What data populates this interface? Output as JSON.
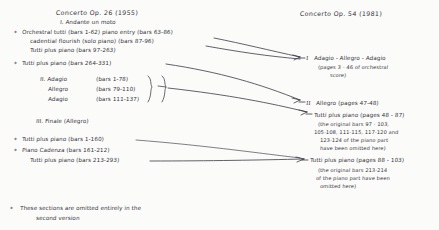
{
  "page": {
    "background_color": "#fbfbf9",
    "ink_color": "#33333c"
  },
  "left_column": {
    "heading": "Concerto Op. 26  (1955)",
    "movement_1": {
      "label": "I. Andante un moto",
      "lines": [
        {
          "star": "*",
          "text": "Orchestral tutti (bars 1-62) piano entry (bars 63-86)"
        },
        {
          "star": "",
          "text": "cadential flourish (solo piano) (bars 87-96)"
        },
        {
          "star": "",
          "text": "Tutti plus piano (bars 97-263)"
        },
        {
          "star": "*",
          "text": "Tutti plus piano (bars 264-331)"
        }
      ]
    },
    "movement_2": {
      "label": "II. Adagio",
      "lines": [
        {
          "text": "Adagio",
          "bars": "(bars 1-78)"
        },
        {
          "text": "Allegro",
          "bars": "(bars 79-110)"
        },
        {
          "text": "Adagio",
          "bars": "(bars 111-137)"
        }
      ]
    },
    "movement_3": {
      "label": "III. Finale (Allegro)",
      "lines": [
        {
          "star": "*",
          "text": "Tutti plus piano (bars 1-160)"
        },
        {
          "star": "*",
          "text": "Piano Cadenza (bars 161-212)"
        },
        {
          "star": "",
          "text": "Tutti plus piano (bars 213-293)"
        }
      ]
    }
  },
  "right_column": {
    "heading": "Concerto   Op. 54  (1981)",
    "entries": [
      {
        "numeral": "I",
        "title": "Adagio - Allegro - Adagio",
        "detail_lines": [
          "(pages 3 - 46 of orchestral",
          "score)"
        ]
      },
      {
        "numeral": "II",
        "title": "Allegro  (pages 47-48)",
        "detail_lines": []
      }
    ],
    "blocks": [
      {
        "title": "Tutti plus piano (pages 48 - 87)",
        "detail_lines": [
          "(the original bars 97 - 103,",
          "105-108, 111-115, 117-120 and",
          "123-124 of the piano part",
          "have been omitted here)"
        ]
      },
      {
        "title": "Tutti plus piano (pages 88 - 103)",
        "detail_lines": [
          "(the original bars 213-214",
          "of the piano part have been",
          "omitted here)"
        ]
      }
    ]
  },
  "footnote": {
    "marker": "*",
    "lines": [
      "These sections are omitted entirely in the",
      "second version"
    ]
  }
}
